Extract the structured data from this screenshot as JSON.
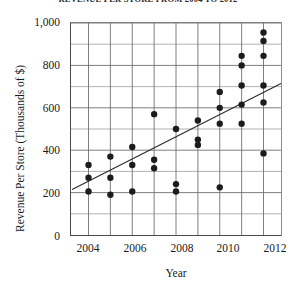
{
  "chart_title": "REVENUE PER STORE FROM 2004 TO 2012",
  "axis": {
    "xlabel": "Year",
    "ylabel": "Revenue Per Store (Thousands of $)",
    "ytick_labels": [
      "1,000",
      "800",
      "600",
      "400",
      "200",
      "0"
    ],
    "xtick_labels": [
      "2004",
      "2006",
      "2008",
      "2010",
      "2012"
    ]
  },
  "chart_data": {
    "type": "scatter",
    "title": "REVENUE PER STORE FROM 2004 TO 2012",
    "xlabel": "Year",
    "ylabel": "Revenue Per Store (Thousands of $)",
    "xlim": [
      2003.2,
      2012.8
    ],
    "ylim": [
      0,
      1000
    ],
    "xticks": [
      2004,
      2006,
      2008,
      2010,
      2012
    ],
    "yticks": [
      0,
      200,
      400,
      600,
      800,
      1000
    ],
    "y_minor_ticks": [
      100,
      300,
      500,
      700,
      900
    ],
    "x_gridlines": [
      2004,
      2005,
      2006,
      2007,
      2008,
      2009,
      2010,
      2011,
      2012
    ],
    "grid": true,
    "legend": null,
    "points": [
      {
        "x": 2004,
        "y": 330
      },
      {
        "x": 2004,
        "y": 270
      },
      {
        "x": 2004,
        "y": 205
      },
      {
        "x": 2005,
        "y": 370
      },
      {
        "x": 2005,
        "y": 270
      },
      {
        "x": 2005,
        "y": 190
      },
      {
        "x": 2006,
        "y": 415
      },
      {
        "x": 2006,
        "y": 330
      },
      {
        "x": 2006,
        "y": 205
      },
      {
        "x": 2007,
        "y": 570
      },
      {
        "x": 2007,
        "y": 355
      },
      {
        "x": 2007,
        "y": 315
      },
      {
        "x": 2008,
        "y": 500
      },
      {
        "x": 2008,
        "y": 240
      },
      {
        "x": 2008,
        "y": 205
      },
      {
        "x": 2009,
        "y": 540
      },
      {
        "x": 2009,
        "y": 450
      },
      {
        "x": 2009,
        "y": 425
      },
      {
        "x": 2010,
        "y": 675
      },
      {
        "x": 2010,
        "y": 600
      },
      {
        "x": 2010,
        "y": 525
      },
      {
        "x": 2010,
        "y": 225
      },
      {
        "x": 2011,
        "y": 845
      },
      {
        "x": 2011,
        "y": 800
      },
      {
        "x": 2011,
        "y": 705
      },
      {
        "x": 2011,
        "y": 615
      },
      {
        "x": 2011,
        "y": 525
      },
      {
        "x": 2012,
        "y": 955
      },
      {
        "x": 2012,
        "y": 915
      },
      {
        "x": 2012,
        "y": 845
      },
      {
        "x": 2012,
        "y": 705
      },
      {
        "x": 2012,
        "y": 625
      },
      {
        "x": 2012,
        "y": 385
      }
    ],
    "trend_line": {
      "x_start": 2003.25,
      "y_start": 215,
      "x_end": 2012.8,
      "y_end": 715
    }
  }
}
